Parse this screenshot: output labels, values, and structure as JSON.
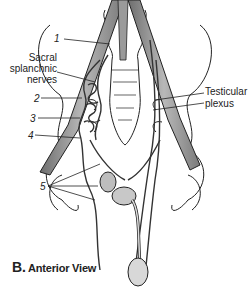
{
  "figure": {
    "caption_letter": "B.",
    "caption_text": "Anterior View",
    "labels": {
      "n1": "1",
      "sacral_line1": "Sacral",
      "sacral_line2": "splanchnic",
      "sacral_line3": "nerves",
      "n2": "2",
      "n3": "3",
      "n4": "4",
      "n5": "5",
      "testicular_line1": "Testicular",
      "testicular_line2": "plexus"
    },
    "colors": {
      "line": "#222222",
      "vessel_fill": "#8a8a8a",
      "vessel_light": "#c8c8c8",
      "organ_fill": "#bdbdbd",
      "background": "#ffffff"
    }
  }
}
